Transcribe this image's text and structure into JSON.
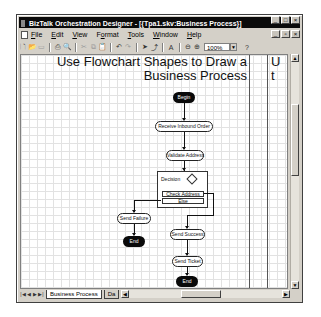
{
  "window": {
    "title": "BizTalk Orchestration Designer - [{Tpa1.skv:Business Process}]",
    "caption_buttons": [
      "_",
      "□",
      "×"
    ],
    "mdi_buttons": [
      "_",
      "▫",
      "×"
    ]
  },
  "menubar": {
    "items": [
      {
        "label": "File",
        "ul": "F",
        "rest": "ile"
      },
      {
        "label": "Edit",
        "ul": "E",
        "rest": "dit"
      },
      {
        "label": "View",
        "ul": "V",
        "rest": "iew"
      },
      {
        "label": "Format",
        "ul": "o",
        "pre": "F",
        "rest": "rmat"
      },
      {
        "label": "Tools",
        "ul": "T",
        "rest": "ools"
      },
      {
        "label": "Window",
        "ul": "W",
        "rest": "indow"
      },
      {
        "label": "Help",
        "ul": "H",
        "rest": "elp"
      }
    ]
  },
  "toolbar": {
    "new_icon": "🗋",
    "open_icon": "📂",
    "save_icon": "▭",
    "print_icon": "⎙",
    "preview_icon": "🔍",
    "cut_icon": "✂",
    "copy_icon": "⧉",
    "paste_icon": "📋",
    "undo_icon": "↶",
    "redo_icon": "↷",
    "pointer_icon": "➤",
    "connector_icon": "⤴",
    "text_icon": "A",
    "zoom_out_icon": "⊖",
    "zoom_in_icon": "⊕",
    "zoom_value": "100%",
    "help_icon": "?"
  },
  "canvas": {
    "heading_line1": "Use Flowchart Shapes to Draw a",
    "heading_line2": "Business Process",
    "heading_right_line1": "U",
    "heading_right_line2": "t",
    "shapes": {
      "begin": "Begin",
      "receive": "Receive Inbound Order",
      "validate": "Validate Address",
      "decision": "Decision",
      "rule1": "Check Address",
      "rule2": "Else",
      "send_failure": "Send Failure",
      "end1": "End",
      "send_success": "Send Success",
      "send_ticket": "Send Ticket",
      "end2": "End"
    }
  },
  "tabs": {
    "nav": [
      "|◀",
      "◀",
      "▶",
      "▶|"
    ],
    "items": [
      {
        "label": "Business Process",
        "active": true
      },
      {
        "label": "Da",
        "active": false
      }
    ]
  }
}
